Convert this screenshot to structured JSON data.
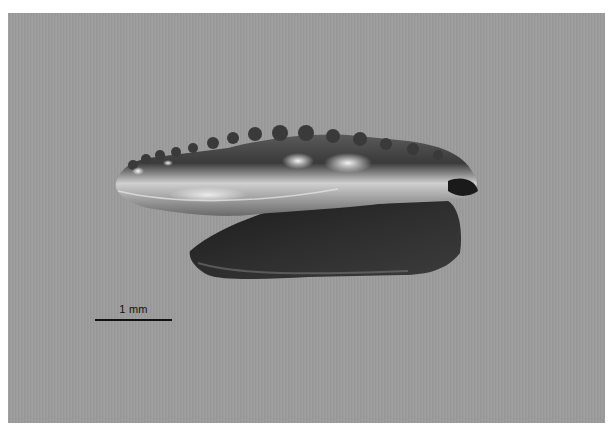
{
  "image": {
    "subject": "fossil conodont element (specimen photograph)",
    "background_color": "#9c9c9c",
    "border_color": "#ffffff"
  },
  "scale_bar": {
    "label": "1 mm"
  }
}
